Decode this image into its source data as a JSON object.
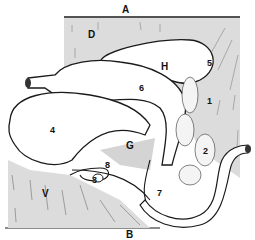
{
  "diagram": {
    "type": "anatomical-illustration",
    "orientation_labels": {
      "top": "A",
      "bottom": "B"
    },
    "region_labels": {
      "dorsal": "D",
      "ventral": "V"
    },
    "organ_labels": [
      {
        "id": "1",
        "text": "1"
      },
      {
        "id": "2",
        "text": "2"
      },
      {
        "id": "3",
        "text": "3"
      },
      {
        "id": "4",
        "text": "4"
      },
      {
        "id": "5",
        "text": "5"
      },
      {
        "id": "6",
        "text": "6"
      },
      {
        "id": "7",
        "text": "7"
      },
      {
        "id": "8",
        "text": "8"
      },
      {
        "id": "G",
        "text": "G"
      },
      {
        "id": "H",
        "text": "H"
      }
    ],
    "colors": {
      "shade": "#dcdcdc",
      "line": "#1a1a1a",
      "background": "#ffffff"
    }
  }
}
